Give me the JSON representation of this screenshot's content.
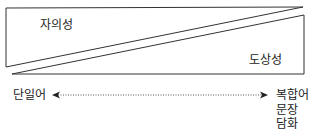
{
  "diagram": {
    "upper_region_label": "자의성",
    "lower_region_label": "도상성",
    "scale_left_label": "단일어",
    "scale_right_labels": [
      "복합어",
      "문장",
      "담화"
    ]
  },
  "colors": {
    "line": "#333333",
    "text": "#222222",
    "background": "#ffffff"
  }
}
